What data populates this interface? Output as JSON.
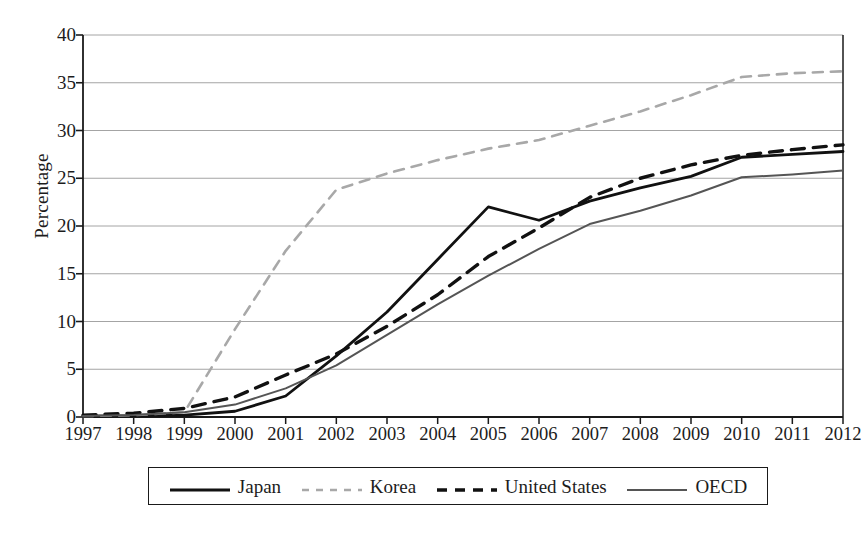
{
  "figure": {
    "background": "#ffffff",
    "axis_color": "#1a1a1a",
    "grid_color": "#9a9a9a"
  },
  "chart_data": {
    "type": "line",
    "title": "",
    "subtitle": "",
    "xlabel": "",
    "ylabel": "Percentage",
    "x": [
      1997,
      1998,
      1999,
      2000,
      2001,
      2002,
      2003,
      2004,
      2005,
      2006,
      2007,
      2008,
      2009,
      2010,
      2011,
      2012
    ],
    "categories": [
      "1997",
      "1998",
      "1999",
      "2000",
      "2001",
      "2002",
      "2003",
      "2004",
      "2005",
      "2006",
      "2007",
      "2008",
      "2009",
      "2010",
      "2011",
      "2012"
    ],
    "xlim": [
      1997,
      2012
    ],
    "ylim": [
      0,
      40
    ],
    "yticks": [
      0,
      5,
      10,
      15,
      20,
      25,
      30,
      35,
      40
    ],
    "ytick_labels": [
      "0",
      "5",
      "10",
      "15",
      "20",
      "25",
      "30",
      "35",
      "40"
    ],
    "grid": "horizontal",
    "legend_position": "bottom",
    "series": [
      {
        "name": "Japan",
        "color": "#111111",
        "style": "solid",
        "width": 2.8,
        "values": [
          0.1,
          0.15,
          0.2,
          0.6,
          2.2,
          6.4,
          11.0,
          16.5,
          22.0,
          20.6,
          22.6,
          24.0,
          25.2,
          27.2,
          27.5,
          27.8
        ]
      },
      {
        "name": "Korea",
        "color": "#a8a8a8",
        "style": "dashed",
        "width": 2.6,
        "values": [
          0.1,
          0.2,
          0.5,
          9.2,
          17.4,
          23.8,
          25.5,
          26.9,
          28.1,
          29.0,
          30.5,
          32.0,
          33.7,
          35.6,
          36.0,
          36.2
        ]
      },
      {
        "name": "United States",
        "color": "#111111",
        "style": "dashed",
        "width": 3.4,
        "values": [
          0.2,
          0.4,
          0.9,
          2.1,
          4.4,
          6.6,
          9.5,
          12.8,
          16.8,
          19.8,
          23.0,
          25.0,
          26.4,
          27.4,
          28.0,
          28.5
        ]
      },
      {
        "name": "OECD",
        "color": "#555555",
        "style": "solid",
        "width": 2.0,
        "values": [
          0.1,
          0.2,
          0.5,
          1.3,
          3.0,
          5.4,
          8.6,
          11.8,
          14.8,
          17.6,
          20.2,
          21.6,
          23.2,
          25.1,
          25.4,
          25.8
        ]
      }
    ]
  },
  "legend": {
    "items": [
      {
        "label": "Japan",
        "swatch": "solid-thick-black-line-swatch"
      },
      {
        "label": "Korea",
        "swatch": "dashed-gray-line-swatch"
      },
      {
        "label": "United States",
        "swatch": "dashed-black-line-swatch"
      },
      {
        "label": "OECD",
        "swatch": "solid-thin-gray-line-swatch"
      }
    ]
  }
}
